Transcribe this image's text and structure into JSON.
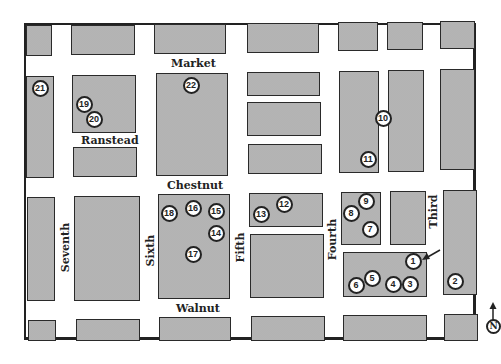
{
  "map": {
    "streets": {
      "horizontal": [
        {
          "name": "Market",
          "x": 171,
          "y": 57
        },
        {
          "name": "Ranstead",
          "x": 79,
          "y": 134
        },
        {
          "name": "Chestnut",
          "x": 166,
          "y": 180
        },
        {
          "name": "Walnut",
          "x": 175,
          "y": 303
        }
      ],
      "vertical": [
        {
          "name": "Seventh",
          "x": 62,
          "y": 268
        },
        {
          "name": "Sixth",
          "x": 149,
          "y": 258
        },
        {
          "name": "Fifth",
          "x": 239,
          "y": 254
        },
        {
          "name": "Fourth",
          "x": 331,
          "y": 240
        },
        {
          "name": "Third",
          "x": 434,
          "y": 210
        }
      ]
    },
    "markers": [
      {
        "label": "1",
        "x": 413,
        "y": 261
      },
      {
        "label": "2",
        "x": 455,
        "y": 281
      },
      {
        "label": "3",
        "x": 410,
        "y": 284
      },
      {
        "label": "4",
        "x": 393,
        "y": 284
      },
      {
        "label": "5",
        "x": 372,
        "y": 278
      },
      {
        "label": "6",
        "x": 356,
        "y": 285
      },
      {
        "label": "7",
        "x": 370,
        "y": 229
      },
      {
        "label": "8",
        "x": 351,
        "y": 213
      },
      {
        "label": "9",
        "x": 366,
        "y": 201
      },
      {
        "label": "10",
        "x": 383,
        "y": 118
      },
      {
        "label": "11",
        "x": 368,
        "y": 159
      },
      {
        "label": "12",
        "x": 284,
        "y": 204
      },
      {
        "label": "13",
        "x": 261,
        "y": 214
      },
      {
        "label": "14",
        "x": 216,
        "y": 233
      },
      {
        "label": "15",
        "x": 216,
        "y": 211
      },
      {
        "label": "16",
        "x": 193,
        "y": 208
      },
      {
        "label": "17",
        "x": 193,
        "y": 254
      },
      {
        "label": "18",
        "x": 169,
        "y": 213
      },
      {
        "label": "19",
        "x": 84,
        "y": 104
      },
      {
        "label": "20",
        "x": 94,
        "y": 119
      },
      {
        "label": "21",
        "x": 40,
        "y": 88
      },
      {
        "label": "22",
        "x": 191,
        "y": 85
      }
    ],
    "north_label": "N",
    "colors": {
      "block_fill": "#c9c9c9",
      "outline": "#222222",
      "background": "#ffffff"
    }
  }
}
